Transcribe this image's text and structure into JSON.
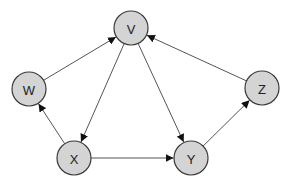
{
  "diagram": {
    "type": "directed-graph",
    "colors": {
      "node_fill": "#d4d4d4",
      "node_stroke": "#3a3a3a",
      "edge": "#555555",
      "background": "#ffffff"
    },
    "nodes": [
      {
        "id": "V",
        "label": "V",
        "x": 131,
        "y": 28,
        "r": 17
      },
      {
        "id": "W",
        "label": "W",
        "x": 29,
        "y": 89,
        "r": 17
      },
      {
        "id": "Z",
        "label": "Z",
        "x": 262,
        "y": 88,
        "r": 17
      },
      {
        "id": "X",
        "label": "X",
        "x": 74,
        "y": 158,
        "r": 17
      },
      {
        "id": "Y",
        "label": "Y",
        "x": 191,
        "y": 158,
        "r": 17
      }
    ],
    "edges": [
      {
        "from": "W",
        "to": "V"
      },
      {
        "from": "Z",
        "to": "V"
      },
      {
        "from": "V",
        "to": "X"
      },
      {
        "from": "V",
        "to": "Y"
      },
      {
        "from": "X",
        "to": "W"
      },
      {
        "from": "X",
        "to": "Y"
      },
      {
        "from": "Y",
        "to": "Z"
      }
    ]
  }
}
